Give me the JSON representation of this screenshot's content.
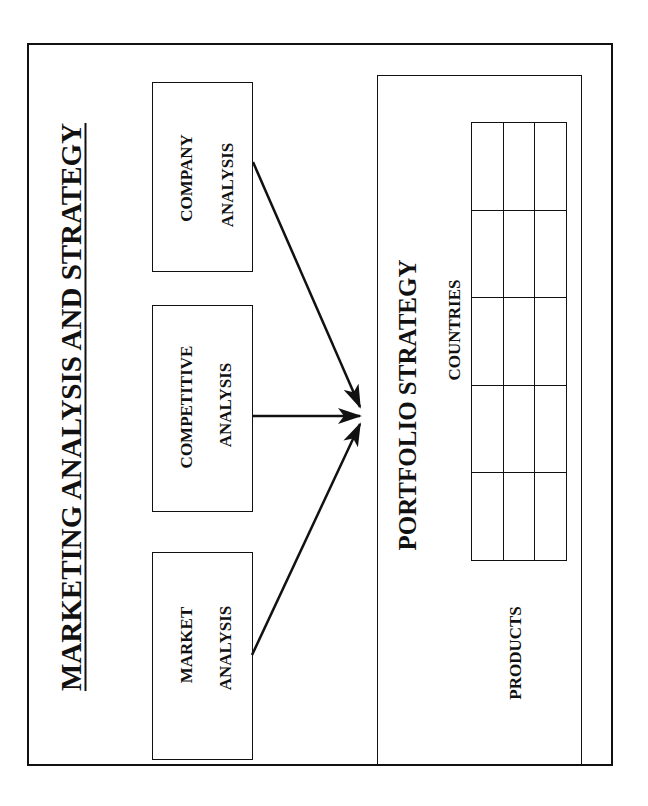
{
  "title": "MARKETING ANALYSIS AND STRATEGY",
  "inputs": [
    {
      "line1": "COMPANY",
      "line2": "ANALYSIS"
    },
    {
      "line1": "COMPETITIVE",
      "line2": "ANALYSIS"
    },
    {
      "line1": "MARKET",
      "line2": "ANALYSIS"
    }
  ],
  "output": {
    "title": "PORTFOLIO STRATEGY",
    "matrix": {
      "column_axis_label": "COUNTRIES",
      "row_axis_label": "PRODUCTS",
      "rows": 5,
      "columns": 3
    }
  },
  "connections": [
    {
      "from": "COMPANY ANALYSIS",
      "to": "PORTFOLIO STRATEGY"
    },
    {
      "from": "COMPETITIVE ANALYSIS",
      "to": "PORTFOLIO STRATEGY"
    },
    {
      "from": "MARKET ANALYSIS",
      "to": "PORTFOLIO STRATEGY"
    }
  ],
  "colors": {
    "stroke": "#111111",
    "background": "#ffffff"
  }
}
